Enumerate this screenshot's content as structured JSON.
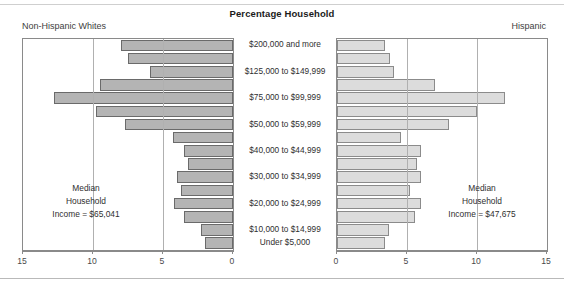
{
  "header": {
    "title": "Percentage Household",
    "left_group_label": "Non-Hispanic Whites",
    "right_group_label": "Hispanic"
  },
  "annotations": {
    "left_median_line1": "Median",
    "left_median_line2": "Household",
    "left_median_line3": "Income = $65,041",
    "right_median_line1": "Median",
    "right_median_line2": "Household",
    "right_median_line3": "Income = $47,675"
  },
  "axis": {
    "left_ticks": [
      "15",
      "10",
      "5",
      "0"
    ],
    "right_ticks": [
      "0",
      "5",
      "10",
      "15"
    ],
    "min": 0,
    "max": 15,
    "step": 5
  },
  "colors": {
    "left_bar_fill": "#b4b4b4",
    "left_bar_stroke": "#6a6a6a",
    "right_bar_fill": "#dcdcdc",
    "right_bar_stroke": "#8b8b8b",
    "frame": "#8a8a8a",
    "gridline": "#b0b0b0",
    "text": "#3a3a3a"
  },
  "chart_data": {
    "type": "bar",
    "subtype": "population-pyramid",
    "title": "Percentage Household",
    "xlabel": "",
    "ylabel": "",
    "xlim": [
      0,
      15
    ],
    "xticks": [
      0,
      5,
      10,
      15
    ],
    "grid": true,
    "legend_position": "panel-corners",
    "orientation": "horizontal-diverging",
    "categories": [
      "$200,000 and more",
      "$150,000 to $199,999",
      "$125,000 to $149,999",
      "$100,000 to $124,999",
      "$75,000 to $99,999",
      "$60,000 to $74,999",
      "$50,000 to $59,999",
      "$45,000 to $49,999",
      "$40,000 to $44,999",
      "$35,000 to $39,999",
      "$30,000 to $34,999",
      "$25,000 to $29,999",
      "$20,000 to $24,999",
      "$15,000 to $19,999",
      "$10,000 to $14,999",
      "Under $5,000"
    ],
    "visible_category_labels": [
      "$200,000 and more",
      "$125,000 to $149,999",
      "$75,000 to $99,999",
      "$50,000 to $59,999",
      "$40,000 to $44,999",
      "$30,000 to $34,999",
      "$20,000 to $24,999",
      "$10,000 to $14,999",
      "Under $5,000"
    ],
    "series": [
      {
        "name": "Non-Hispanic Whites",
        "side": "left",
        "median_household_income": "$65,041",
        "values": [
          8.0,
          7.5,
          5.9,
          9.5,
          12.8,
          9.8,
          7.7,
          4.3,
          3.5,
          3.2,
          4.0,
          3.7,
          4.2,
          3.5,
          2.3,
          2.0
        ]
      },
      {
        "name": "Hispanic",
        "side": "right",
        "median_household_income": "$47,675",
        "values": [
          3.4,
          3.8,
          4.1,
          7.0,
          12.0,
          10.0,
          8.0,
          4.6,
          6.0,
          5.7,
          6.0,
          5.2,
          6.0,
          5.6,
          3.7,
          3.4
        ]
      }
    ]
  }
}
